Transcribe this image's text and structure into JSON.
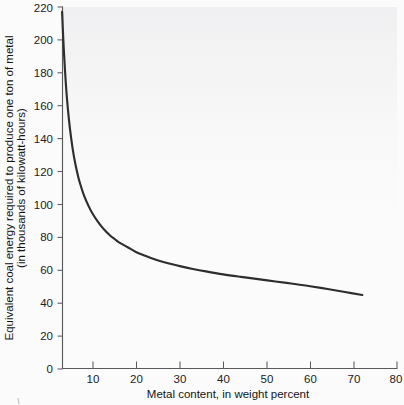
{
  "chart_data": {
    "type": "line",
    "title": "",
    "xlabel": "Metal content, in weight percent",
    "ylabel_line1": "Equivalent coal energy required to produce one ton of metal",
    "ylabel_line2": "(in thousands of kilowatt-hours)",
    "xlim": [
      0,
      80
    ],
    "ylim": [
      0,
      220
    ],
    "grid": false,
    "legend": null,
    "xticks": [
      10,
      20,
      30,
      40,
      50,
      60,
      70,
      80
    ],
    "xtick_labels": [
      "10",
      "20",
      "30",
      "40",
      "50",
      "60",
      "70",
      "80"
    ],
    "yticks": [
      0,
      20,
      40,
      60,
      80,
      100,
      120,
      140,
      160,
      180,
      200,
      220
    ],
    "ytick_labels": [
      "0",
      "20",
      "40",
      "60",
      "80",
      "100",
      "120",
      "140",
      "160",
      "180",
      "200",
      "220"
    ],
    "series": [
      {
        "name": "Equivalent coal energy",
        "curve_color": "#2e2e2e",
        "x": [
          2.9,
          3.2,
          3.6,
          4.0,
          4.5,
          5.0,
          5.5,
          6.0,
          6.5,
          7.0,
          8.0,
          9.0,
          10.0,
          11.0,
          12.0,
          13.0,
          14.0,
          15.0,
          16.0,
          18.0,
          20.0,
          22.0,
          24.0,
          26.0,
          28.0,
          30.0,
          33.0,
          36.0,
          40.0,
          44.0,
          48.0,
          52.0,
          56.0,
          60.0,
          64.0,
          68.0,
          72.0
        ],
        "y": [
          217.0,
          199.0,
          180.0,
          165.0,
          151.0,
          140.0,
          131.0,
          124.0,
          118.0,
          113.0,
          105.0,
          99.0,
          94.0,
          90.0,
          86.5,
          83.5,
          81.0,
          79.0,
          77.0,
          74.0,
          71.0,
          68.8,
          66.8,
          65.2,
          63.8,
          62.5,
          60.8,
          59.3,
          57.5,
          56.0,
          54.6,
          53.2,
          51.8,
          50.3,
          48.6,
          46.8,
          45.0
        ]
      }
    ],
    "annotations": []
  },
  "axes": {
    "x_axis_name": "x-axis",
    "y_axis_name": "y-axis"
  }
}
